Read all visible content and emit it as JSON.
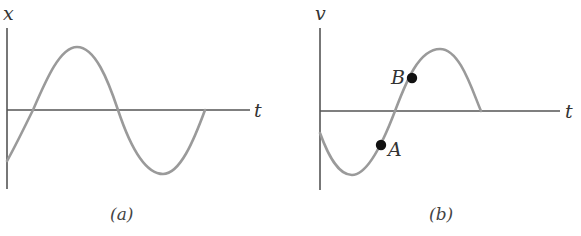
{
  "panel_a": {
    "y_axis_label": "x",
    "x_axis_label": "t",
    "caption": "(a)",
    "colors": {
      "axis": "#555555",
      "curve": "#9a9a9a"
    }
  },
  "panel_b": {
    "y_axis_label": "v",
    "x_axis_label": "t",
    "caption": "(b)",
    "points": [
      {
        "label": "A"
      },
      {
        "label": "B"
      }
    ],
    "colors": {
      "axis": "#555555",
      "curve": "#9a9a9a",
      "point": "#111111"
    }
  }
}
